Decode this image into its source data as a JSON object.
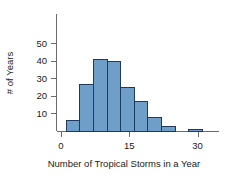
{
  "chart_data": {
    "type": "bar",
    "title": "",
    "subtitle": "",
    "xlabel": "Number of Tropical Storms in a Year",
    "ylabel": "# of Years",
    "grid": false,
    "legend": false,
    "legend_position": "none",
    "bin_width": 3,
    "bin_starts": [
      1,
      4,
      7,
      10,
      13,
      16,
      19,
      22,
      28
    ],
    "categories": [
      "1-4",
      "4-7",
      "7-10",
      "10-13",
      "13-16",
      "16-19",
      "19-22",
      "22-25",
      "28-31"
    ],
    "values": [
      6,
      27,
      41,
      40,
      25,
      17,
      8,
      3,
      1
    ],
    "x_ticks": [
      0,
      15,
      30
    ],
    "x_tick_labels": [
      "0",
      "15",
      "30"
    ],
    "xlim": [
      -2,
      34
    ],
    "y_ticks": [
      10,
      20,
      30,
      40,
      50
    ],
    "y_tick_labels": [
      "10",
      "20",
      "30",
      "40",
      "50"
    ],
    "ylim": [
      0,
      53
    ],
    "bar_fill_color": "#6f9fc8",
    "bar_edge_color": "#1f3a5f",
    "axis_color": "#6b6b6b",
    "text_color": "#1a1a1a",
    "background_color": "#ffffff"
  }
}
